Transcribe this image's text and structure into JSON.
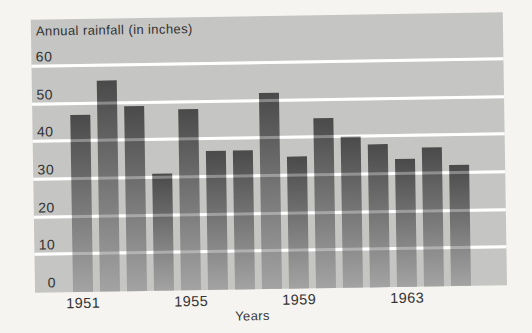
{
  "page": {
    "background_color": "#f5f4f0"
  },
  "chart_data": {
    "type": "bar",
    "title": "Annual rainfall (in inches)",
    "xlabel": "Years",
    "ylabel": "Annual rainfall (in inches)",
    "categories": [
      "1951",
      "1952",
      "1953",
      "1954",
      "1955",
      "1956",
      "1957",
      "1958",
      "1959",
      "1960",
      "1961",
      "1962",
      "1963",
      "1964",
      "1965"
    ],
    "values": [
      47,
      56,
      49,
      31,
      48,
      37,
      37,
      52,
      35,
      45,
      40,
      38,
      34,
      37,
      32
    ],
    "x_tick_labels": [
      "1951",
      "1955",
      "1959",
      "1963"
    ],
    "x_tick_indices": [
      0,
      4,
      8,
      12
    ],
    "y_tick_labels": [
      60,
      50,
      40,
      30,
      20,
      10,
      0
    ],
    "gridline_values": [
      10,
      20,
      30,
      40,
      50,
      60
    ],
    "ylim": [
      0,
      72
    ],
    "grid": true,
    "legend": false,
    "colors": {
      "bar_top": "#4a4a4a",
      "bar_bottom": "#a3a3a3",
      "plot_background": "#c5c5c3",
      "gridline": "#ffffff",
      "text": "#3a3a3a"
    }
  }
}
